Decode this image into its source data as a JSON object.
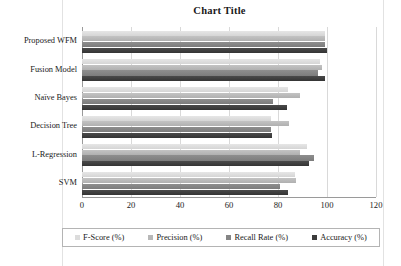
{
  "chart_data": {
    "type": "bar",
    "orientation": "horizontal",
    "title": "Chart Title",
    "xlabel": "",
    "ylabel": "",
    "xlim": [
      0,
      120
    ],
    "xticks": [
      0,
      20,
      40,
      60,
      80,
      100,
      120
    ],
    "xtick_labels": [
      "0",
      "20",
      "40",
      "60",
      "80",
      "100",
      "120"
    ],
    "grid": true,
    "grid_axis": "x",
    "legend_position": "bottom",
    "categories": [
      "Proposed WFM",
      "Fusion Model",
      "Naïve Bayes",
      "Decision Tree",
      "L-Regression",
      "SVM"
    ],
    "series": [
      {
        "name": "F-Score (%)",
        "color": "#dcdcdc",
        "values": [
          99,
          97,
          84,
          77,
          92,
          87
        ]
      },
      {
        "name": "Precision (%)",
        "color": "#b8b8b8",
        "values": [
          99,
          98,
          89,
          84.5,
          89,
          87.5
        ]
      },
      {
        "name": "Recall Rate (%)",
        "color": "#858585",
        "values": [
          99,
          96.5,
          78,
          77,
          94.5,
          81
        ]
      },
      {
        "name": "Accuracy (%)",
        "color": "#3c3c3c",
        "values": [
          100,
          99,
          83.5,
          77.5,
          92.5,
          84
        ]
      }
    ]
  },
  "legend": {
    "items": [
      {
        "label": "F-Score (%)"
      },
      {
        "label": "Precision (%)"
      },
      {
        "label": "Recall Rate (%)"
      },
      {
        "label": "Accuracy (%)"
      }
    ]
  }
}
